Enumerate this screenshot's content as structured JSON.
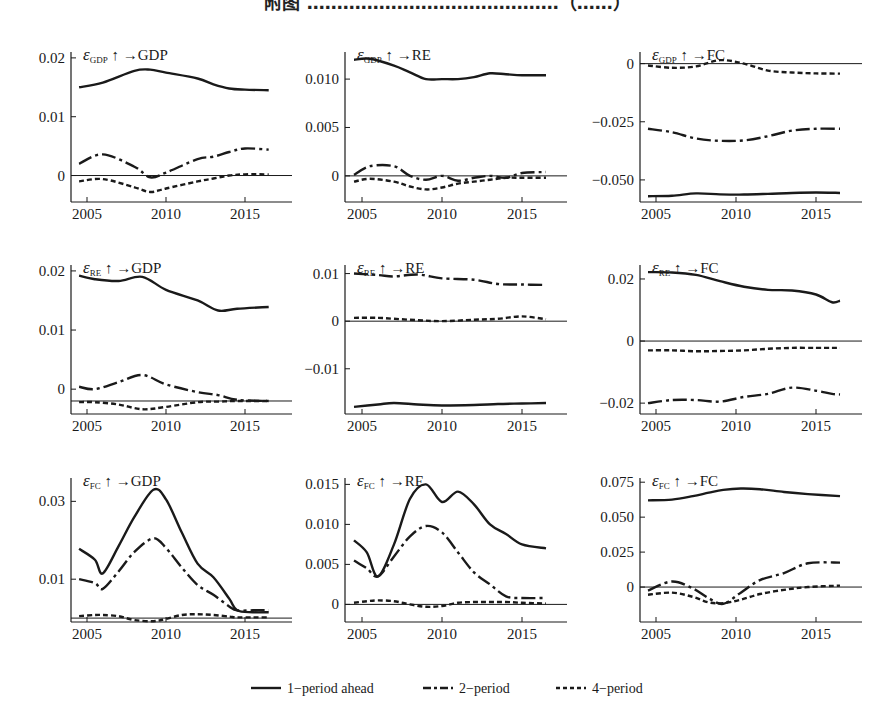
{
  "title": "附图   ……………………………………（……）",
  "legend": [
    {
      "key": "s1",
      "label": "1-period ahead",
      "style": "solid"
    },
    {
      "key": "s2",
      "label": "2-period",
      "style": "dashdot"
    },
    {
      "key": "s4",
      "label": "4-period",
      "style": "dashed"
    }
  ],
  "colors": {
    "line": "#1a1a1a",
    "axis": "#1a1a1a",
    "background": "#ffffff"
  },
  "chart_data": [
    {
      "type": "line",
      "title": "ε_GDP ↑ → GDP",
      "shock": "GDP",
      "response": "GDP",
      "x_ticks": [
        2005,
        2010,
        2015
      ],
      "y_ticks": [
        0,
        0.01,
        0.02
      ],
      "y_tick_labels": [
        "0",
        "0.01",
        "0.02"
      ],
      "ylim": [
        -0.0045,
        0.021
      ],
      "hline": 0,
      "x": [
        2004.5,
        2006,
        2008,
        2009,
        2010,
        2012,
        2013,
        2014,
        2015,
        2016.5
      ],
      "series": [
        {
          "name": "1-period ahead",
          "values": [
            0.015,
            0.0158,
            0.0178,
            0.018,
            0.0175,
            0.0165,
            0.0155,
            0.0148,
            0.0146,
            0.0145
          ]
        },
        {
          "name": "2-period",
          "values": [
            0.002,
            0.0036,
            0.0015,
            -0.0003,
            0.0005,
            0.0028,
            0.0032,
            0.004,
            0.0046,
            0.0044
          ]
        },
        {
          "name": "4-period",
          "values": [
            -0.001,
            -0.0006,
            -0.002,
            -0.0028,
            -0.0022,
            -0.001,
            -0.0005,
            0.0,
            0.0002,
            0.0002
          ]
        }
      ]
    },
    {
      "type": "line",
      "title": "ε_GDP ↑ → RE",
      "shock": "GDP",
      "response": "RE",
      "x_ticks": [
        2005,
        2010,
        2015
      ],
      "y_ticks": [
        0,
        0.005,
        0.01
      ],
      "y_tick_labels": [
        "0",
        "0.005",
        "0.010"
      ],
      "ylim": [
        -0.0027,
        0.0128
      ],
      "hline": 0,
      "x": [
        2004.5,
        2005.5,
        2007,
        2008,
        2009,
        2010,
        2011,
        2012,
        2013,
        2014,
        2015,
        2016.5
      ],
      "series": [
        {
          "name": "1-period ahead",
          "values": [
            0.012,
            0.0121,
            0.0114,
            0.0107,
            0.01,
            0.01,
            0.01,
            0.0102,
            0.0106,
            0.0105,
            0.0104,
            0.0104
          ]
        },
        {
          "name": "2-period",
          "values": [
            0.0001,
            0.001,
            0.001,
            0.0,
            -0.0004,
            0.0,
            -0.0005,
            -0.0002,
            0.0,
            -0.0002,
            0.0003,
            0.0004
          ]
        },
        {
          "name": "4-period",
          "values": [
            -0.0006,
            -0.0003,
            -0.0006,
            -0.0011,
            -0.0014,
            -0.0012,
            -0.0008,
            -0.0006,
            -0.0004,
            -0.0002,
            -0.0002,
            -0.0002
          ]
        }
      ]
    },
    {
      "type": "line",
      "title": "ε_GDP ↑ → FC",
      "shock": "GDP",
      "response": "FC",
      "x_ticks": [
        2005,
        2010,
        2015
      ],
      "y_ticks": [
        -0.05,
        -0.025,
        0
      ],
      "y_tick_labels": [
        "-0.050",
        "-0.025",
        "0"
      ],
      "ylim": [
        -0.0595,
        0.005
      ],
      "hline": 0,
      "x": [
        2004.5,
        2006,
        2007.5,
        2009,
        2010.5,
        2012,
        2013.5,
        2015,
        2016.5
      ],
      "series": [
        {
          "name": "1-period ahead",
          "values": [
            -0.057,
            -0.0568,
            -0.0558,
            -0.0562,
            -0.0563,
            -0.056,
            -0.0556,
            -0.0554,
            -0.0556
          ]
        },
        {
          "name": "2-period",
          "values": [
            -0.028,
            -0.0295,
            -0.0322,
            -0.0332,
            -0.033,
            -0.0312,
            -0.0288,
            -0.028,
            -0.028
          ]
        },
        {
          "name": "4-period",
          "values": [
            -0.0008,
            -0.0018,
            -0.0012,
            0.0015,
            0.0,
            -0.003,
            -0.0038,
            -0.0042,
            -0.0043
          ]
        }
      ]
    },
    {
      "type": "line",
      "title": "ε_RE ↑ → GDP",
      "shock": "RE",
      "response": "GDP",
      "x_ticks": [
        2005,
        2010,
        2015
      ],
      "y_ticks": [
        0,
        0.01,
        0.02
      ],
      "y_tick_labels": [
        "0",
        "0.01",
        "0.02"
      ],
      "ylim": [
        -0.0042,
        0.021
      ],
      "hline": -0.002,
      "x": [
        2004.5,
        2005.5,
        2007,
        2008.5,
        2010,
        2012,
        2013.3,
        2014.5,
        2016.5
      ],
      "series": [
        {
          "name": "1-period ahead",
          "values": [
            0.0192,
            0.0186,
            0.0183,
            0.019,
            0.0168,
            0.015,
            0.0133,
            0.0136,
            0.0139
          ]
        },
        {
          "name": "2-period",
          "values": [
            0.0004,
            0.0,
            0.0012,
            0.0024,
            0.0008,
            -0.0005,
            -0.001,
            -0.0018,
            -0.002
          ]
        },
        {
          "name": "4-period",
          "values": [
            -0.0022,
            -0.0022,
            -0.0026,
            -0.0034,
            -0.003,
            -0.0022,
            -0.0021,
            -0.002,
            -0.002
          ]
        }
      ]
    },
    {
      "type": "line",
      "title": "ε_RE ↑ → RE",
      "shock": "RE",
      "response": "RE",
      "x_ticks": [
        2005,
        2010,
        2015
      ],
      "y_ticks": [
        -0.01,
        0,
        0.01
      ],
      "y_tick_labels": [
        "-0.01",
        "0",
        "0.01"
      ],
      "ylim": [
        -0.0195,
        0.0118
      ],
      "hline": 0,
      "x": [
        2004.5,
        2006,
        2007,
        2008.5,
        2010,
        2012,
        2013.5,
        2015,
        2016.5
      ],
      "series": [
        {
          "name": "1-period ahead",
          "values": [
            -0.018,
            -0.0175,
            -0.0172,
            -0.0175,
            -0.0177,
            -0.0176,
            -0.0174,
            -0.0173,
            -0.0172
          ]
        },
        {
          "name": "2-period",
          "values": [
            0.01,
            0.0097,
            0.0094,
            0.0098,
            0.009,
            0.0087,
            0.0078,
            0.0077,
            0.0076
          ]
        },
        {
          "name": "4-period",
          "values": [
            0.0007,
            0.0007,
            0.0005,
            0.0002,
            0.0,
            0.0003,
            0.0005,
            0.001,
            0.0004
          ]
        }
      ]
    },
    {
      "type": "line",
      "title": "ε_RE ↑ → FC",
      "shock": "RE",
      "response": "FC",
      "x_ticks": [
        2005,
        2010,
        2015
      ],
      "y_ticks": [
        -0.02,
        0,
        0.02
      ],
      "y_tick_labels": [
        "-0.02",
        "0",
        "0.02"
      ],
      "ylim": [
        -0.0235,
        0.0245
      ],
      "hline": 0,
      "x": [
        2004.5,
        2006,
        2007.5,
        2009,
        2010.5,
        2012,
        2013.5,
        2015,
        2016,
        2016.5
      ],
      "series": [
        {
          "name": "1-period ahead",
          "values": [
            0.0222,
            0.0221,
            0.0213,
            0.0193,
            0.0175,
            0.0165,
            0.0163,
            0.015,
            0.0125,
            0.013
          ]
        },
        {
          "name": "2-period",
          "values": [
            -0.02,
            -0.019,
            -0.019,
            -0.0195,
            -0.018,
            -0.017,
            -0.015,
            -0.016,
            -0.017,
            -0.0172
          ]
        },
        {
          "name": "4-period",
          "values": [
            -0.003,
            -0.003,
            -0.0033,
            -0.0032,
            -0.003,
            -0.0025,
            -0.0022,
            -0.0022,
            -0.0022,
            -0.0022
          ]
        }
      ]
    },
    {
      "type": "line",
      "title": "ε_FC ↑ → GDP",
      "shock": "FC",
      "response": "GDP",
      "x_ticks": [
        2005,
        2010,
        2015
      ],
      "y_ticks": [
        0.01,
        0.03
      ],
      "y_tick_labels": [
        "0.01",
        "0.03"
      ],
      "ylim": [
        -0.001,
        0.036
      ],
      "hline": 0,
      "x": [
        2004.5,
        2005.5,
        2006,
        2007,
        2008,
        2009.2,
        2010,
        2011,
        2012,
        2013,
        2014,
        2014.5,
        2015.5,
        2016.5
      ],
      "series": [
        {
          "name": "1-period ahead",
          "values": [
            0.0178,
            0.015,
            0.0115,
            0.0185,
            0.026,
            0.033,
            0.0305,
            0.022,
            0.014,
            0.0105,
            0.005,
            0.002,
            0.0015,
            0.0015
          ]
        },
        {
          "name": "2-period",
          "values": [
            0.01,
            0.009,
            0.0075,
            0.012,
            0.017,
            0.0205,
            0.018,
            0.013,
            0.0085,
            0.006,
            0.003,
            0.002,
            0.002,
            0.002
          ]
        },
        {
          "name": "4-period",
          "values": [
            0.0005,
            0.0008,
            0.0008,
            0.0005,
            -0.0005,
            -0.0008,
            -0.0002,
            0.0008,
            0.001,
            0.0008,
            0.0004,
            0.0002,
            0.0002,
            0.0002
          ]
        }
      ]
    },
    {
      "type": "line",
      "title": "ε_FC ↑ → RE",
      "shock": "FC",
      "response": "RE",
      "x_ticks": [
        2005,
        2010,
        2015
      ],
      "y_ticks": [
        0,
        0.005,
        0.01,
        0.015
      ],
      "y_tick_labels": [
        "0",
        "0.005",
        "0.010",
        "0.015"
      ],
      "ylim": [
        -0.0022,
        0.0158
      ],
      "hline": 0,
      "x": [
        2004.5,
        2005.3,
        2006,
        2007,
        2008,
        2009,
        2010,
        2011,
        2012,
        2013,
        2014,
        2015,
        2016.5
      ],
      "series": [
        {
          "name": "1-period ahead",
          "values": [
            0.008,
            0.0065,
            0.0035,
            0.0075,
            0.0132,
            0.015,
            0.0128,
            0.0141,
            0.0125,
            0.01,
            0.0088,
            0.0075,
            0.007
          ]
        },
        {
          "name": "2-period",
          "values": [
            0.0055,
            0.0045,
            0.0035,
            0.006,
            0.0085,
            0.0098,
            0.009,
            0.0065,
            0.004,
            0.0025,
            0.001,
            0.0008,
            0.0008
          ]
        },
        {
          "name": "4-period",
          "values": [
            0.0002,
            0.0004,
            0.0005,
            0.0004,
            0.0,
            -0.0003,
            -0.0002,
            0.0002,
            0.0003,
            0.0003,
            0.0003,
            0.0002,
            0.0001
          ]
        }
      ]
    },
    {
      "type": "line",
      "title": "ε_FC ↑ → FC",
      "shock": "FC",
      "response": "FC",
      "x_ticks": [
        2005,
        2010,
        2015
      ],
      "y_ticks": [
        0,
        0.025,
        0.05,
        0.075
      ],
      "y_tick_labels": [
        "0",
        "0.025",
        "0.050",
        "0.075"
      ],
      "ylim": [
        -0.025,
        0.078
      ],
      "hline": 0,
      "x": [
        2004.5,
        2006,
        2007.3,
        2008.3,
        2009.2,
        2010.3,
        2011.5,
        2013,
        2014.5,
        2016.5
      ],
      "series": [
        {
          "name": "1-period ahead",
          "values": [
            0.062,
            0.0625,
            0.065,
            0.0675,
            0.0695,
            0.0705,
            0.07,
            0.068,
            0.0665,
            0.065
          ]
        },
        {
          "name": "2-period",
          "values": [
            -0.0025,
            0.004,
            -0.001,
            -0.008,
            -0.012,
            -0.004,
            0.005,
            0.01,
            0.017,
            0.0175
          ]
        },
        {
          "name": "4-period",
          "values": [
            -0.0055,
            -0.004,
            -0.007,
            -0.011,
            -0.0115,
            -0.009,
            -0.005,
            -0.002,
            0.0,
            0.001
          ]
        }
      ]
    }
  ]
}
